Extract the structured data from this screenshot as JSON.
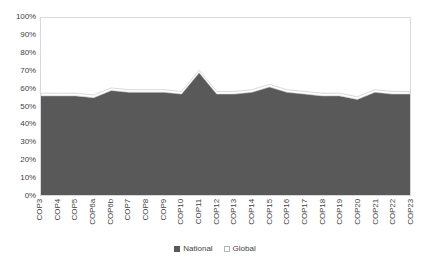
{
  "chart_data": {
    "type": "area",
    "title": "",
    "xlabel": "",
    "ylabel": "",
    "ylim": [
      0,
      100
    ],
    "y_unit": "%",
    "grid": false,
    "legend_position": "bottom",
    "stacked": true,
    "categories": [
      "COP3",
      "COP4",
      "COP5",
      "COP6a",
      "COP6b",
      "COP7",
      "COP8",
      "COP9",
      "COP10",
      "COP11",
      "COP12",
      "COP13",
      "COP14",
      "COP15",
      "COP16",
      "COP17",
      "COP18",
      "COP19",
      "COP20",
      "COP21",
      "COP22",
      "COP23"
    ],
    "y_ticks": [
      "0%",
      "10%",
      "20%",
      "30%",
      "40%",
      "50%",
      "60%",
      "70%",
      "80%",
      "90%",
      "100%"
    ],
    "y_tick_values": [
      0,
      10,
      20,
      30,
      40,
      50,
      60,
      70,
      80,
      90,
      100
    ],
    "series": [
      {
        "name": "National",
        "color": "#595959",
        "values": [
          56,
          56,
          56,
          55,
          59,
          58,
          58,
          58,
          57,
          69,
          57,
          57,
          58,
          61,
          58,
          57,
          56,
          56,
          54,
          58,
          57,
          57
        ]
      },
      {
        "name": "Global",
        "color": "#ffffff",
        "values": [
          1.5,
          1.5,
          1.5,
          1.5,
          1.5,
          1.5,
          1.5,
          1.5,
          1.5,
          1.5,
          1.5,
          1.5,
          1.5,
          1.5,
          1.5,
          1.5,
          1.5,
          1.5,
          1.5,
          1.5,
          1.5,
          1.5
        ]
      }
    ],
    "series_totals": [
      57.5,
      57.5,
      57.5,
      56.5,
      60.5,
      59.5,
      59.5,
      59.5,
      58.5,
      70.5,
      58.5,
      58.5,
      59.5,
      62.5,
      59.5,
      58.5,
      57.5,
      57.5,
      55.5,
      59.5,
      58.5,
      58.5
    ]
  },
  "legend": {
    "entries": [
      {
        "label": "National",
        "swatch": "national"
      },
      {
        "label": "Global",
        "swatch": "global"
      }
    ]
  },
  "colors": {
    "national": "#595959",
    "global": "#ffffff",
    "border": "#d9d9d9",
    "text": "#3f3f3f",
    "background": "#ffffff"
  }
}
